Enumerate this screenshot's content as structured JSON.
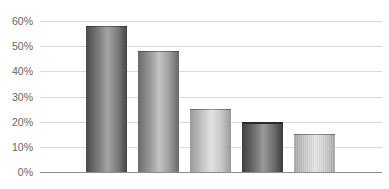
{
  "chart_data": {
    "type": "bar",
    "title": "",
    "xlabel": "",
    "ylabel": "",
    "categories": [
      "",
      "",
      "",
      "",
      ""
    ],
    "values": [
      58,
      48,
      25,
      20,
      15
    ],
    "value_format": "percent",
    "ylim": [
      0,
      60
    ],
    "yticks": [
      "0%",
      "10%",
      "20%",
      "30%",
      "40%",
      "50%",
      "60%"
    ],
    "ytick_values": [
      0,
      10,
      20,
      30,
      40,
      50,
      60
    ],
    "grid": true,
    "legend": null,
    "bar_style": "3d-cylinder-gradient-grayscale",
    "bar_colors": [
      "#7a7a7a",
      "#9a9a9a",
      "#c8c8c8",
      "#6e6e6e",
      "#cccccc"
    ],
    "gridline_color": "#d9d9d9",
    "axis_color": "#8c8c8c",
    "label_color": "#666666"
  }
}
